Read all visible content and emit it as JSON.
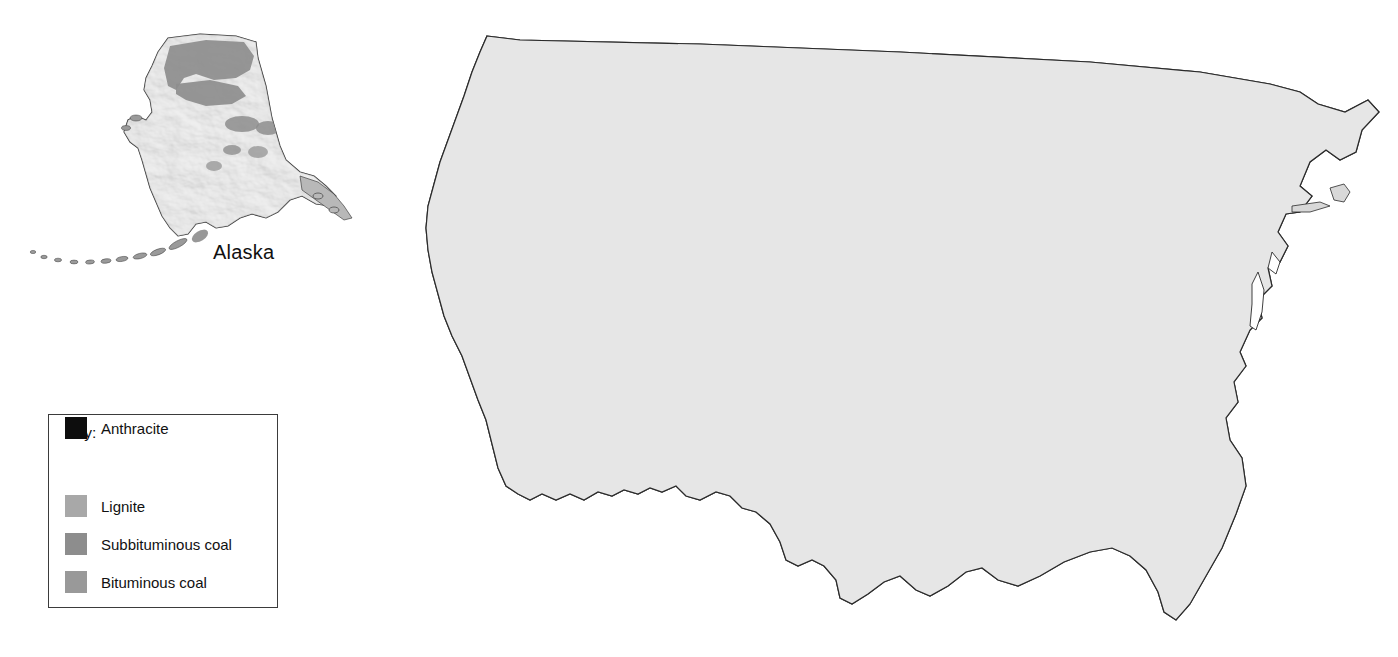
{
  "figure": {
    "type": "thematic-map",
    "projection_note": "Conterminous US with Alaska inset",
    "background_color": "#ffffff"
  },
  "legend": {
    "title": "Key:",
    "box_border_color": "#3b3b3b",
    "items": [
      {
        "label": "Lignite",
        "color": "#a8a8a8",
        "key": "lignite"
      },
      {
        "label": "Subbituminous coal",
        "color": "#8d8d8d",
        "key": "subbituminous"
      },
      {
        "label": "Bituminous coal",
        "color": "#999999",
        "key": "bituminous"
      },
      {
        "label": "Anthracite",
        "color": "#0d0d0d",
        "key": "anthracite"
      }
    ]
  },
  "map_labels": [
    {
      "text": "Alaska",
      "name": "alaska-label"
    }
  ],
  "palette": {
    "land_base": "#e3e3e3",
    "land_highlight": "#f2f2f2",
    "land_shadow": "#c9c9c9",
    "water": "#ffffff",
    "state_border": "#4a4a4a",
    "coast_outline": "#2a2a2a",
    "lignite": "#a8a8a8",
    "subbituminous": "#8d8d8d",
    "bituminous": "#999999",
    "anthracite": "#0d0d0d"
  },
  "deposits": {
    "note": "Coal-bearing areas rendered as shaded polygons over shaded-relief land",
    "regions": [
      {
        "name": "Northern Great Plains (Powder River Basin)",
        "type": "subbituminous"
      },
      {
        "name": "Williston Basin (North Dakota)",
        "type": "lignite"
      },
      {
        "name": "Green River / Uinta Basin",
        "type": "bituminous"
      },
      {
        "name": "San Juan / Raton Basin (Four Corners)",
        "type": "subbituminous"
      },
      {
        "name": "Illinois Basin",
        "type": "bituminous"
      },
      {
        "name": "Appalachian Basin",
        "type": "bituminous"
      },
      {
        "name": "Michigan Basin",
        "type": "bituminous"
      },
      {
        "name": "Gulf Coast lignite belt",
        "type": "lignite"
      },
      {
        "name": "Pennsylvania anthracite field",
        "type": "anthracite"
      },
      {
        "name": "Narragansett Basin (Rhode Island)",
        "type": "anthracite"
      },
      {
        "name": "Eastern Kentucky / Virginia anthracite",
        "type": "anthracite"
      },
      {
        "name": "Northern Alaska (North Slope)",
        "type": "subbituminous"
      },
      {
        "name": "Cook Inlet / Matanuska (Alaska)",
        "type": "bituminous"
      },
      {
        "name": "Western Washington (Puget)",
        "type": "anthracite"
      }
    ]
  }
}
